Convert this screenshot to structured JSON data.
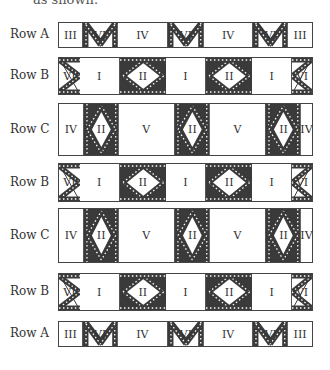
{
  "caption": "as shown.",
  "colors": {
    "dark": "#3a3a3a",
    "line": "#444444",
    "bg": "#ffffff"
  },
  "rows": [
    {
      "label": "Row A",
      "type": "A",
      "top": 22,
      "height": 26,
      "segments": [
        "III",
        "VI",
        "IV",
        "VI",
        "IV",
        "VI",
        "III"
      ]
    },
    {
      "label": "Row B",
      "type": "B",
      "top": 57,
      "height": 38,
      "segments": [
        "VI",
        "I",
        "II",
        "I",
        "II",
        "I",
        "VI"
      ]
    },
    {
      "label": "Row C",
      "type": "C",
      "top": 103,
      "height": 53,
      "segments": [
        "IV",
        "II",
        "V",
        "II",
        "V",
        "II",
        "IV"
      ]
    },
    {
      "label": "Row B",
      "type": "B",
      "top": 163,
      "height": 39,
      "segments": [
        "VI",
        "I",
        "II",
        "I",
        "II",
        "I",
        "VI"
      ]
    },
    {
      "label": "Row C",
      "type": "C",
      "top": 208,
      "height": 55,
      "segments": [
        "IV",
        "II",
        "V",
        "II",
        "V",
        "II",
        "IV"
      ]
    },
    {
      "label": "Row B",
      "type": "B",
      "top": 273,
      "height": 38,
      "segments": [
        "VI",
        "I",
        "II",
        "I",
        "II",
        "I",
        "VI"
      ]
    },
    {
      "label": "Row A",
      "type": "A",
      "top": 321,
      "height": 26,
      "segments": [
        "III",
        "VI",
        "IV",
        "VI",
        "IV",
        "VI",
        "III"
      ]
    }
  ]
}
